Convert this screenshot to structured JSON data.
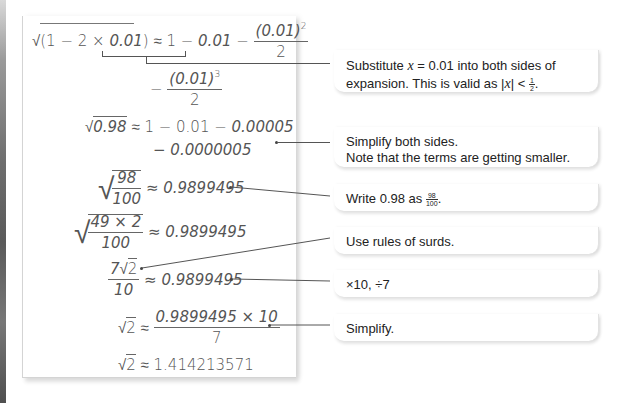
{
  "working": {
    "line1": {
      "lhs_sqrt_open": "√(1 − 2 × ",
      "lhs_x": "0.01",
      "lhs_close": ")",
      "approx": " ≈ 1 − ",
      "rhs_x": "0.01",
      "minus": " − ",
      "frac_num_base": "(0.01)",
      "frac_num_exp": "2",
      "frac_den": "2"
    },
    "line2": {
      "minus": "− ",
      "frac_num_base": "(0.01)",
      "frac_num_exp": "3",
      "frac_den": "2"
    },
    "line3": {
      "sqrt_sym": "√",
      "radicand": "0.98",
      "rhs": " ≈ 1 − 0.01 − ",
      "rhs_it": "0.00005"
    },
    "line4": {
      "text": "− 0.0000005"
    },
    "line5": {
      "sqrt_sym": "√",
      "num": "98",
      "den": "100",
      "rhs": " ≈ 0.9899495"
    },
    "line6": {
      "sqrt_sym": "√",
      "num": "49 × 2",
      "den": "100",
      "rhs": " ≈ 0.9899495"
    },
    "line7": {
      "num_coef": "7",
      "num_sqrt": "√",
      "num_rad": "2",
      "den": "10",
      "rhs": " ≈ 0.9899495"
    },
    "line8": {
      "sqrt_sym": "√",
      "rad": "2",
      "approx": " ≈ ",
      "num": "0.9899495 × 10",
      "den": "7"
    },
    "line9": {
      "sqrt_sym": "√",
      "rad": "2",
      "rhs": " ≈ 1.414213571"
    }
  },
  "callouts": [
    {
      "text_a": "Substitute ",
      "var": "x",
      "text_b": " = 0.01 into both sides of",
      "text_c": "expansion. This is valid as |",
      "var2": "x",
      "text_d": "| < ",
      "frac_num": "1",
      "frac_den": "2",
      "text_e": "."
    },
    {
      "line1": "Simplify both sides.",
      "line2": "Note that the terms are getting smaller."
    },
    {
      "text_a": "Write 0.98 as ",
      "frac_num": "98",
      "frac_den": "100",
      "text_b": "."
    },
    {
      "text": "Use rules of surds."
    },
    {
      "text": "×10, ÷7"
    },
    {
      "text": "Simplify."
    }
  ],
  "colors": {
    "math_text": "#555555",
    "callout_text": "#222222",
    "connector": "#555555",
    "panel_border": "#d4d4d4"
  }
}
